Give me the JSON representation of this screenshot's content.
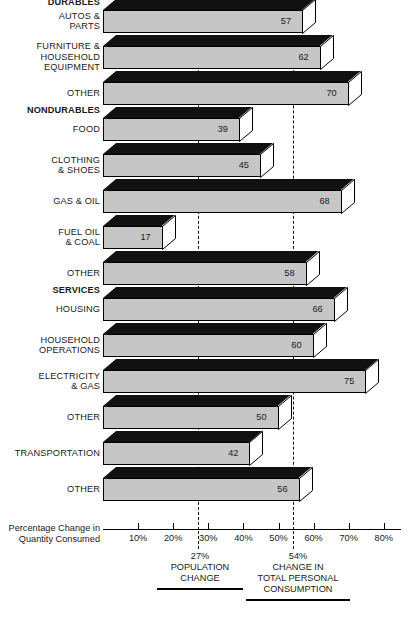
{
  "chart_data": {
    "type": "bar",
    "orientation": "horizontal",
    "title": "",
    "xlabel": "Percentage Change in Quantity Consumed",
    "ylabel": "",
    "xlim": [
      0,
      85
    ],
    "xticks": [
      10,
      20,
      30,
      40,
      50,
      60,
      70,
      80
    ],
    "xtick_labels": [
      "10%",
      "20%",
      "30%",
      "40%",
      "50%",
      "60%",
      "70%",
      "80%"
    ],
    "grid": false,
    "legend_position": "below-axis",
    "categories": [
      "AUTOS &\nPARTS",
      "FURNITURE &\nHOUSEHOLD\nEQUIPMENT",
      "OTHER",
      "FOOD",
      "CLOTHING\n& SHOES",
      "GAS & OIL",
      "FUEL OIL\n& COAL",
      "OTHER",
      "HOUSING",
      "HOUSEHOLD\nOPERATIONS",
      "ELECTRICITY\n& GAS",
      "OTHER",
      "TRANSPORTATION",
      "OTHER"
    ],
    "values": [
      57,
      62,
      70,
      39,
      45,
      68,
      17,
      58,
      66,
      60,
      75,
      50,
      42,
      56
    ],
    "group_headers": [
      "DURABLES",
      "NONDURABLES",
      "SERVICES"
    ],
    "groups": [
      {
        "name": "DURABLES",
        "categories": [
          "AUTOS & PARTS",
          "FURNITURE & HOUSEHOLD EQUIPMENT",
          "OTHER"
        ],
        "values": [
          57,
          62,
          70
        ]
      },
      {
        "name": "NONDURABLES",
        "categories": [
          "FOOD",
          "CLOTHING & SHOES",
          "GAS & OIL",
          "FUEL OIL & COAL",
          "OTHER"
        ],
        "values": [
          39,
          45,
          68,
          17,
          58
        ]
      },
      {
        "name": "SERVICES",
        "categories": [
          "HOUSING",
          "HOUSEHOLD OPERATIONS",
          "ELECTRICITY & GAS",
          "OTHER",
          "TRANSPORTATION",
          "OTHER"
        ],
        "values": [
          66,
          60,
          75,
          50,
          42,
          56
        ]
      }
    ],
    "reference_lines": [
      {
        "value": 27,
        "label_pct": "27%",
        "label": "POPULATION\nCHANGE"
      },
      {
        "value": 54,
        "label_pct": "54%",
        "label": "CHANGE IN\nTOTAL PERSONAL\nCONSUMPTION"
      }
    ],
    "colors": {
      "bar_front": "#c6c6c6",
      "bar_top": "#111111",
      "bar_side": "#ffffff",
      "outline": "#000000",
      "text": "#1a1a1a"
    }
  },
  "rows": [
    {
      "group": "DURABLES",
      "label": "AUTOS &\nPARTS",
      "value": 57,
      "value_text": "57"
    },
    {
      "group": "",
      "label": "FURNITURE &\nHOUSEHOLD\nEQUIPMENT",
      "value": 62,
      "value_text": "62"
    },
    {
      "group": "",
      "label": "OTHER",
      "value": 70,
      "value_text": "70"
    },
    {
      "group": "NONDURABLES",
      "label": "FOOD",
      "value": 39,
      "value_text": "39"
    },
    {
      "group": "",
      "label": "CLOTHING\n& SHOES",
      "value": 45,
      "value_text": "45"
    },
    {
      "group": "",
      "label": "GAS & OIL",
      "value": 68,
      "value_text": "68"
    },
    {
      "group": "",
      "label": "FUEL OIL\n& COAL",
      "value": 17,
      "value_text": "17"
    },
    {
      "group": "",
      "label": "OTHER",
      "value": 58,
      "value_text": "58"
    },
    {
      "group": "SERVICES",
      "label": "HOUSING",
      "value": 66,
      "value_text": "66"
    },
    {
      "group": "",
      "label": "HOUSEHOLD\nOPERATIONS",
      "value": 60,
      "value_text": "60"
    },
    {
      "group": "",
      "label": "ELECTRICITY\n& GAS",
      "value": 75,
      "value_text": "75"
    },
    {
      "group": "",
      "label": "OTHER",
      "value": 50,
      "value_text": "50"
    },
    {
      "group": "",
      "label": "TRANSPORTATION",
      "value": 42,
      "value_text": "42"
    },
    {
      "group": "",
      "label": "OTHER",
      "value": 56,
      "value_text": "56"
    }
  ],
  "axis": {
    "caption": "Percentage Change in\nQuantity Consumed",
    "ticks": [
      {
        "value": 10,
        "label": "10%"
      },
      {
        "value": 20,
        "label": "20%"
      },
      {
        "value": 30,
        "label": "30%"
      },
      {
        "value": 40,
        "label": "40%"
      },
      {
        "value": 50,
        "label": "50%"
      },
      {
        "value": 60,
        "label": "60%"
      },
      {
        "value": 70,
        "label": "70%"
      },
      {
        "value": 80,
        "label": "80%"
      }
    ]
  },
  "callouts": [
    {
      "pct": "27%",
      "text": "POPULATION\nCHANGE",
      "value": 27
    },
    {
      "pct": "54%",
      "text": "CHANGE IN\nTOTAL PERSONAL\nCONSUMPTION",
      "value": 54
    }
  ]
}
